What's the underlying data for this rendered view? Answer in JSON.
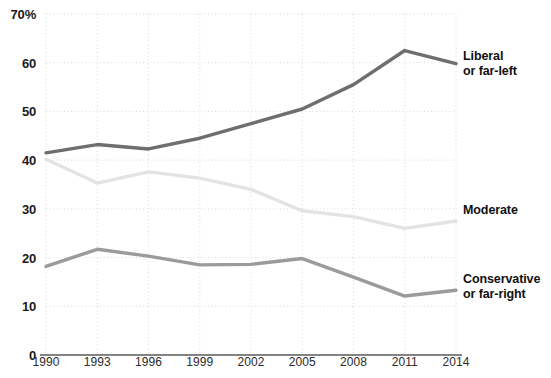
{
  "chart_data": {
    "type": "line",
    "title": "",
    "subtitle": "",
    "xlabel": "",
    "ylabel": "",
    "x": [
      1990,
      1993,
      1996,
      1999,
      2002,
      2005,
      2008,
      2011,
      2014
    ],
    "categories": [
      "1990",
      "1993",
      "1996",
      "1999",
      "2002",
      "2005",
      "2008",
      "2011",
      "2014"
    ],
    "xlim": [
      1990,
      2014
    ],
    "ylim": [
      0,
      70
    ],
    "y_ticks": [
      0,
      10,
      20,
      30,
      40,
      50,
      60,
      70
    ],
    "y_tick_labels": [
      "0",
      "10",
      "20",
      "30",
      "40",
      "50",
      "60",
      "70%"
    ],
    "grid": true,
    "grid_style": "dotted",
    "legend": "inline-right-labels",
    "series": [
      {
        "name": "Liberal or far-left",
        "label_lines": [
          "Liberal",
          "or far-left"
        ],
        "color": "#6e6e6e",
        "values": [
          41.5,
          43.2,
          42.3,
          44.5,
          47.5,
          50.5,
          55.5,
          62.5,
          59.8
        ]
      },
      {
        "name": "Moderate",
        "label_lines": [
          "Moderate"
        ],
        "color": "#e3e3e3",
        "values": [
          40.2,
          35.3,
          37.6,
          36.3,
          34.0,
          29.6,
          28.4,
          26.0,
          27.5
        ]
      },
      {
        "name": "Conservative or far-right",
        "label_lines": [
          "Conservative",
          "or far-right"
        ],
        "color": "#9b9b9b",
        "values": [
          18.2,
          21.7,
          20.3,
          18.5,
          18.6,
          19.8,
          16.0,
          12.1,
          13.3
        ]
      }
    ]
  },
  "axis": {
    "y_labels": [
      {
        "text": "70%",
        "value": 70
      },
      {
        "text": "60",
        "value": 60
      },
      {
        "text": "50",
        "value": 50
      },
      {
        "text": "40",
        "value": 40
      },
      {
        "text": "30",
        "value": 30
      },
      {
        "text": "20",
        "value": 20
      },
      {
        "text": "10",
        "value": 10
      },
      {
        "text": "0",
        "value": 0
      }
    ],
    "x_labels": [
      {
        "text": "1990",
        "value": 1990
      },
      {
        "text": "1993",
        "value": 1993
      },
      {
        "text": "1996",
        "value": 1996
      },
      {
        "text": "1999",
        "value": 1999
      },
      {
        "text": "2002",
        "value": 2002
      },
      {
        "text": "2005",
        "value": 2005
      },
      {
        "text": "2008",
        "value": 2008
      },
      {
        "text": "2011",
        "value": 2011
      },
      {
        "text": "2014",
        "value": 2014
      }
    ],
    "axis_line_color": "#5a5a5a",
    "grid_color": "#d8d8d8"
  },
  "series_labels": [
    {
      "id": "liberal",
      "line1": "Liberal",
      "line2": "or far-left"
    },
    {
      "id": "moderate",
      "line1": "Moderate",
      "line2": ""
    },
    {
      "id": "conservative",
      "line1": "Conservative",
      "line2": "or far-right"
    }
  ]
}
